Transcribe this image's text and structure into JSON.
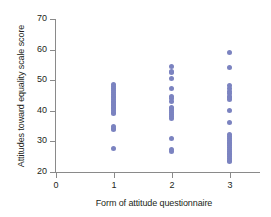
{
  "chart_data": {
    "type": "scatter",
    "title": "",
    "xlabel": "Form of attitude questionnaire",
    "ylabel": "Attitudes toward equality scale score",
    "xlim": [
      0,
      3.45
    ],
    "ylim": [
      20,
      70
    ],
    "xticks": [
      0,
      1,
      2,
      3
    ],
    "xtick_labels": [
      "0",
      "1",
      "2",
      "3"
    ],
    "yticks": [
      20,
      30,
      40,
      50,
      60,
      70
    ],
    "ytick_labels": [
      "20",
      "30",
      "40",
      "50",
      "60",
      "70"
    ],
    "grid": false,
    "legend": false,
    "marker_color": "#7b83c0",
    "axis_color": "#8a8a8a",
    "text_color": "#231f20",
    "series": [
      {
        "name": "Form 1",
        "x": 1,
        "values": [
          48.6,
          47.8,
          47.2,
          46.6,
          46.0,
          45.4,
          44.8,
          44.2,
          43.6,
          43.1,
          42.6,
          42.1,
          41.6,
          41.1,
          40.6,
          40.1,
          39.6,
          39.2,
          34.9,
          34.3,
          33.8,
          27.6
        ]
      },
      {
        "name": "Form 2",
        "x": 2,
        "values": [
          54.4,
          53.0,
          52.4,
          50.6,
          47.2,
          44.6,
          44.0,
          43.2,
          41.2,
          40.6,
          40.0,
          39.4,
          38.8,
          38.2,
          37.6,
          30.8,
          27.4,
          26.6
        ]
      },
      {
        "name": "Form 3",
        "x": 3,
        "values": [
          59.0,
          54.0,
          48.2,
          47.2,
          46.4,
          45.6,
          44.8,
          44.2,
          43.6,
          40.2,
          36.3,
          32.2,
          31.6,
          31.0,
          30.4,
          29.8,
          29.2,
          28.6,
          28.0,
          27.4,
          26.8,
          26.2,
          25.6,
          25.0,
          24.4,
          23.8,
          23.3
        ]
      }
    ]
  }
}
